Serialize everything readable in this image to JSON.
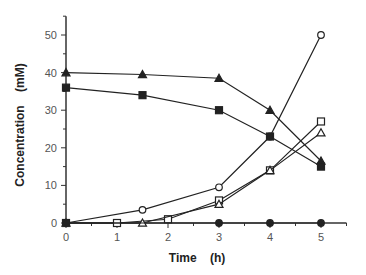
{
  "chart_data": {
    "type": "line",
    "title": "",
    "xlabel": "Time    (h)",
    "ylabel": "Concentration    (mM)",
    "xlim": [
      0,
      5.5
    ],
    "ylim": [
      0,
      55
    ],
    "xticks": [
      0,
      1,
      2,
      3,
      4,
      5
    ],
    "yticks": [
      0,
      10,
      20,
      30,
      40,
      50
    ],
    "grid": false,
    "legend": null,
    "series": [
      {
        "name": "open-circle",
        "marker": "circle",
        "filled": false,
        "x": [
          0,
          1.5,
          3,
          4,
          5
        ],
        "y": [
          0,
          3.5,
          9.5,
          23,
          50
        ]
      },
      {
        "name": "open-square",
        "marker": "square",
        "filled": false,
        "x": [
          0,
          1,
          2,
          3,
          4,
          5
        ],
        "y": [
          0,
          0,
          1,
          6,
          14,
          27
        ]
      },
      {
        "name": "open-triangle",
        "marker": "triangle",
        "filled": false,
        "x": [
          0,
          1.5,
          3,
          4,
          5
        ],
        "y": [
          0,
          0,
          5,
          14,
          24
        ]
      },
      {
        "name": "filled-triangle",
        "marker": "triangle",
        "filled": true,
        "x": [
          0,
          1.5,
          3,
          4,
          5
        ],
        "y": [
          40,
          39.5,
          38.5,
          30,
          16.5
        ]
      },
      {
        "name": "filled-square",
        "marker": "square",
        "filled": true,
        "x": [
          0,
          1.5,
          3,
          4,
          5
        ],
        "y": [
          36,
          34,
          30,
          23,
          15
        ]
      },
      {
        "name": "filled-circle",
        "marker": "circle",
        "filled": true,
        "x": [
          0,
          3,
          4,
          5
        ],
        "y": [
          0,
          0,
          0,
          0
        ]
      }
    ]
  },
  "colors": {
    "line": "#222222",
    "axis": "#333333",
    "background": "#ffffff"
  }
}
